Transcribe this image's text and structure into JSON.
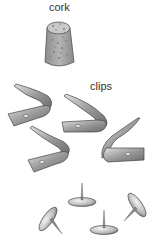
{
  "labels": {
    "cork": "cork",
    "clips": "clips"
  },
  "items": [
    {
      "name": "cork",
      "count": 1
    },
    {
      "name": "clips",
      "count": 4
    },
    {
      "name": "thumbtacks",
      "count": 4
    }
  ],
  "colors": {
    "cork_fill": "#a8a8a8",
    "cork_top": "#c8c8c8",
    "cork_spots": "#7a7a7a",
    "metal_light": "#d8d8d8",
    "metal_mid": "#9a9a9a",
    "metal_dark": "#555555",
    "outline": "#444444"
  }
}
